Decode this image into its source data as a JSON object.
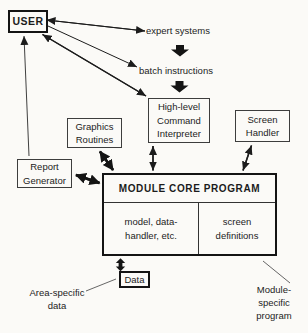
{
  "diagram": {
    "colors": {
      "background": "#fbfaf7",
      "ink": "#1c1c1c",
      "thin_border": "#3d3d3d"
    },
    "nodes": {
      "user": {
        "label": "USER"
      },
      "graphics_routines": {
        "lines": [
          "Graphics",
          "Routines"
        ]
      },
      "command_interpreter": {
        "lines": [
          "High-level",
          "Command",
          "Interpreter"
        ]
      },
      "screen_handler": {
        "lines": [
          "Screen",
          "Handler"
        ]
      },
      "report_generator": {
        "lines": [
          "Report",
          "Generator"
        ]
      },
      "module_core_program": {
        "title": "MODULE CORE PROGRAM",
        "left_cell_lines": [
          "model, data-",
          "handler, etc."
        ],
        "right_cell_lines": [
          "screen",
          "definitions"
        ]
      },
      "data": {
        "label": "Data"
      }
    },
    "labels": {
      "expert_systems": "expert systems",
      "batch_instructions": "batch instructions",
      "area_specific": {
        "lines": [
          "Area-specific",
          "data"
        ]
      },
      "module_specific": {
        "lines": [
          "Module-",
          "specific",
          "program"
        ]
      }
    }
  }
}
